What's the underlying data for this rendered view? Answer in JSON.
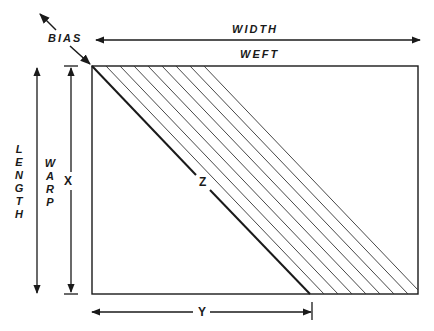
{
  "diagram": {
    "labels": {
      "bias": "BIAS",
      "width": "WIDTH",
      "weft": "WEFT",
      "length": "LENGTH",
      "warp": "WARP",
      "x": "X",
      "y": "Y",
      "z": "Z"
    },
    "colors": {
      "ink": "#1a1a1a",
      "background": "#ffffff"
    },
    "rectangle": {
      "x": 92,
      "y": 66,
      "width": 326,
      "height": 228
    },
    "diagonal_z": {
      "x1": 92,
      "y1": 66,
      "x2": 310,
      "y2": 294
    },
    "hatch_lines": [
      {
        "x1": 106,
        "x2": 324
      },
      {
        "x1": 120,
        "x2": 338
      },
      {
        "x1": 134,
        "x2": 352
      },
      {
        "x1": 148,
        "x2": 366
      },
      {
        "x1": 162,
        "x2": 380
      },
      {
        "x1": 176,
        "x2": 394
      },
      {
        "x1": 190,
        "x2": 408
      },
      {
        "x1": 204,
        "x2": 418
      }
    ]
  }
}
